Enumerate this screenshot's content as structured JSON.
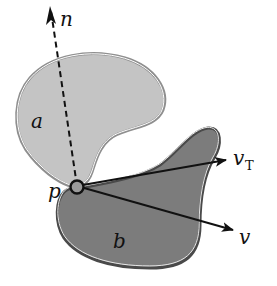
{
  "figure": {
    "type": "contact-geometry-diagram",
    "colors": {
      "background": "#ffffff",
      "body_a_fill": "#c4c4c4",
      "body_a_outline": "#8f8f8f",
      "body_b_fill": "#7c7c7c",
      "body_b_outline": "#4a4a4a",
      "inner_highlight": "#ffffff",
      "arrow": "#111111"
    },
    "bodies": [
      {
        "id": "a",
        "label": "a",
        "shade": "light gray"
      },
      {
        "id": "b",
        "label": "b",
        "shade": "dark gray"
      }
    ],
    "contact_point": {
      "label": "p"
    },
    "vectors": [
      {
        "id": "n",
        "label": "n",
        "subscript": "",
        "style": "dashed",
        "meaning": "normal"
      },
      {
        "id": "vT",
        "label": "v",
        "subscript": "T",
        "style": "solid",
        "meaning": "tangential velocity"
      },
      {
        "id": "v",
        "label": "v",
        "subscript": "",
        "style": "solid",
        "meaning": "velocity"
      }
    ]
  }
}
